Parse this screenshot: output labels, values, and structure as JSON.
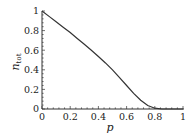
{
  "chart_data": {
    "type": "line",
    "title": "",
    "xlabel": "p",
    "ylabel": "n_tot",
    "ylabel_main": "n",
    "ylabel_sub": "tot",
    "xlim": [
      0,
      1
    ],
    "ylim": [
      0,
      1
    ],
    "grid": false,
    "legend": null,
    "x_ticks": [
      "0",
      "0.2",
      "0.4",
      "0.6",
      "0.8",
      "1"
    ],
    "y_ticks": [
      "0",
      "0.2",
      "0.4",
      "0.6",
      "0.8",
      "1"
    ],
    "series": [
      {
        "name": "n_tot",
        "color": "#333333",
        "x": [
          0,
          0.05,
          0.1,
          0.15,
          0.2,
          0.25,
          0.3,
          0.35,
          0.4,
          0.45,
          0.5,
          0.55,
          0.6,
          0.65,
          0.7,
          0.75,
          0.8,
          0.85,
          0.9,
          0.95,
          1.0
        ],
        "y": [
          1.0,
          0.945,
          0.89,
          0.835,
          0.78,
          0.72,
          0.66,
          0.6,
          0.535,
          0.47,
          0.4,
          0.32,
          0.24,
          0.16,
          0.09,
          0.035,
          0.008,
          0.0,
          0.0,
          0.0,
          0.0
        ]
      }
    ]
  }
}
